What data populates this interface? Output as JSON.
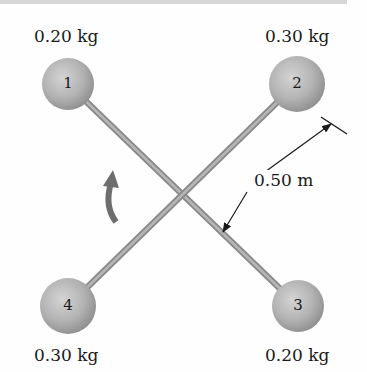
{
  "diagram": {
    "type": "rigid body with four point masses on crossed rods",
    "masses": [
      {
        "id": "1",
        "label": "1",
        "mass_label": "0.20 kg",
        "position": "top-left"
      },
      {
        "id": "2",
        "label": "2",
        "mass_label": "0.30 kg",
        "position": "top-right"
      },
      {
        "id": "3",
        "label": "3",
        "mass_label": "0.20 kg",
        "position": "bottom-right"
      },
      {
        "id": "4",
        "label": "4",
        "mass_label": "0.30 kg",
        "position": "bottom-left"
      }
    ],
    "dimension": {
      "label": "0.50 m",
      "meaning": "distance from rod 1-3 to mass 2"
    },
    "rotation_arrow": {
      "direction": "counterclockwise",
      "icon": "curved-arrow-icon"
    },
    "colors": {
      "sphere": "#b4b4b4",
      "rod": "#9a9a9a",
      "text": "#1a1a1a",
      "arrow": "#6e6e6e"
    }
  }
}
